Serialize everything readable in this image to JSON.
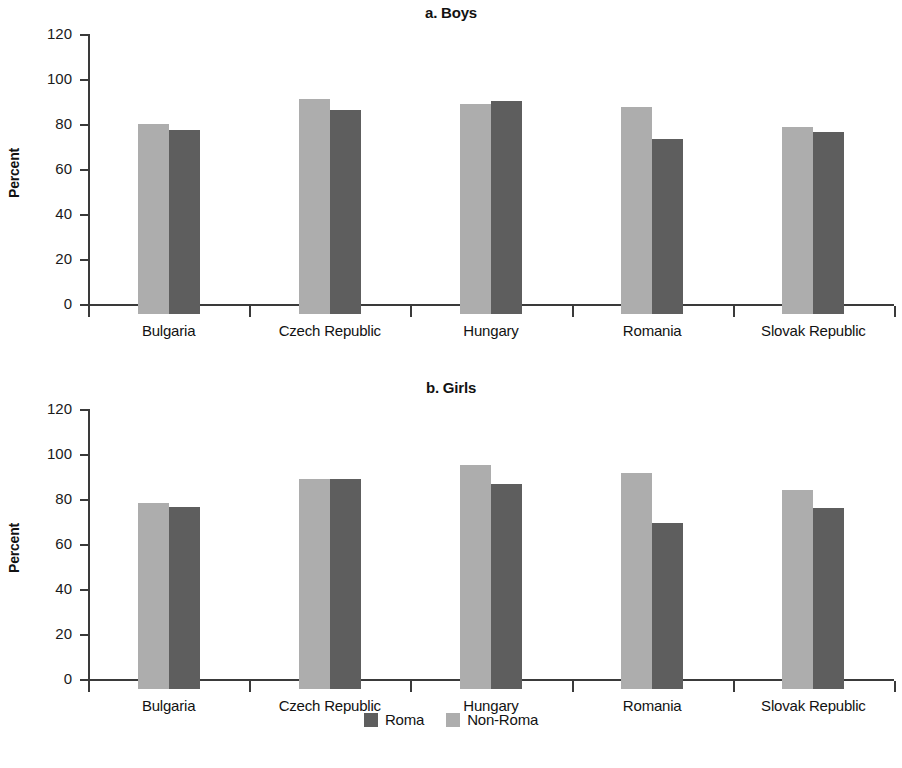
{
  "figure": {
    "ylabel": "Percent",
    "legend": [
      {
        "label": "Roma",
        "color": "#5e5e5e",
        "key": "roma"
      },
      {
        "label": "Non-Roma",
        "color": "#adadad",
        "key": "non_roma"
      }
    ]
  },
  "chart_data": [
    {
      "type": "bar",
      "title": "a. Boys",
      "xlabel": "",
      "ylabel": "Percent",
      "ylim": [
        0,
        120
      ],
      "yticks": [
        0,
        20,
        40,
        60,
        80,
        100,
        120
      ],
      "ytick_labels": [
        "0",
        "20",
        "40",
        "60",
        "80",
        "100",
        "120"
      ],
      "grid": false,
      "legend_position": "bottom",
      "categories": [
        "Bulgaria",
        "Czech Republic",
        "Hungary",
        "Romania",
        "Slovak Republic"
      ],
      "series": [
        {
          "name": "Non-Roma",
          "color": "#adadad",
          "values": [
            84.5,
            95.5,
            93.5,
            92.0,
            83.0
          ]
        },
        {
          "name": "Roma",
          "color": "#5e5e5e",
          "values": [
            82.0,
            90.5,
            94.5,
            78.0,
            81.0
          ]
        }
      ]
    },
    {
      "type": "bar",
      "title": "b. Girls",
      "xlabel": "",
      "ylabel": "Percent",
      "ylim": [
        0,
        120
      ],
      "yticks": [
        0,
        20,
        40,
        60,
        80,
        100,
        120
      ],
      "ytick_labels": [
        "0",
        "20",
        "40",
        "60",
        "80",
        "100",
        "120"
      ],
      "grid": false,
      "legend_position": "bottom",
      "categories": [
        "Bulgaria",
        "Czech Republic",
        "Hungary",
        "Romania",
        "Slovak Republic"
      ],
      "series": [
        {
          "name": "Non-Roma",
          "color": "#adadad",
          "values": [
            82.5,
            93.5,
            99.5,
            96.0,
            88.5
          ]
        },
        {
          "name": "Roma",
          "color": "#5e5e5e",
          "values": [
            81.0,
            93.5,
            91.0,
            74.0,
            80.5
          ]
        }
      ]
    }
  ]
}
